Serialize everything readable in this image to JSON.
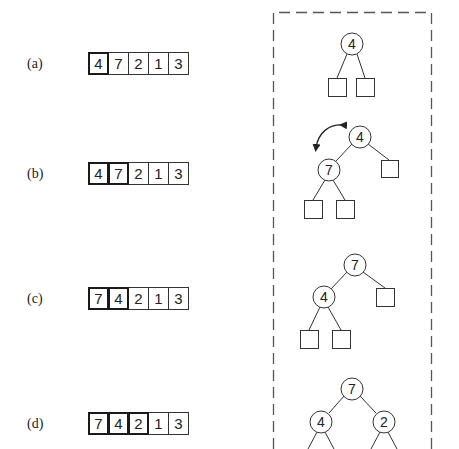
{
  "rows": [
    {
      "label": "(a)",
      "array": [
        4,
        7,
        2,
        1,
        3
      ],
      "heap_size": 1
    },
    {
      "label": "(b)",
      "array": [
        4,
        7,
        2,
        1,
        3
      ],
      "heap_size": 2
    },
    {
      "label": "(c)",
      "array": [
        7,
        4,
        2,
        1,
        3
      ],
      "heap_size": 2
    },
    {
      "label": "(d)",
      "array": [
        7,
        4,
        2,
        1,
        3
      ],
      "heap_size": 3
    }
  ],
  "trees": {
    "a": {
      "root": "4"
    },
    "b": {
      "root": "4",
      "left": "7",
      "swap_arrow": true
    },
    "c": {
      "root": "7",
      "left": "4"
    },
    "d": {
      "root": "7",
      "left": "4",
      "right": "2"
    }
  },
  "colors": {
    "stroke": "#333333",
    "dash": "#555555",
    "text": "#222222"
  }
}
